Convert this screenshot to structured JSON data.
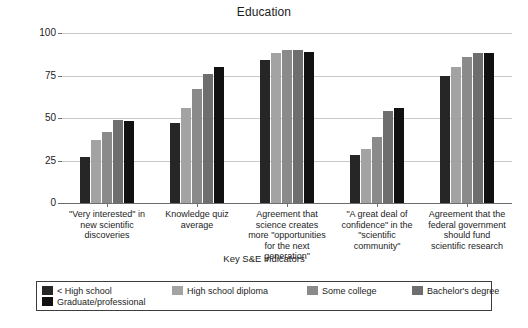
{
  "chart_data": {
    "type": "bar",
    "title": "Education",
    "xlabel": "Key S&E indicators",
    "ylabel": "Percent",
    "ylim": [
      0,
      100
    ],
    "yticks": [
      0,
      25,
      50,
      75,
      100
    ],
    "ytick_labels": [
      "0",
      "25",
      "50",
      "75",
      "100"
    ],
    "grid": true,
    "legend_position": "bottom",
    "categories": [
      "\"Very interested\" in new scientific discoveries",
      "Knowledge quiz average",
      "Agreement that science creates more \"opportunities for the next generation\"",
      "\"A great deal of confidence\" in the \"scientific community\"",
      "Agreement that the federal government should fund scientific research"
    ],
    "category_lines": [
      [
        "\"Very interested\" in",
        "new scientific",
        "discoveries"
      ],
      [
        "Knowledge quiz",
        "average"
      ],
      [
        "Agreement that",
        "science creates",
        "more \"opportunities",
        "for the next",
        "generation\""
      ],
      [
        "\"A great deal of",
        "confidence\" in the",
        "\"scientific",
        "community\""
      ],
      [
        "Agreement that the",
        "federal government",
        "should fund",
        "scientific research"
      ]
    ],
    "series": [
      {
        "name": "< High school",
        "color": "#262626",
        "values": [
          27,
          47,
          84,
          28,
          75
        ]
      },
      {
        "name": "High school diploma",
        "color": "#a3a3a3",
        "values": [
          37,
          56,
          88,
          32,
          80
        ]
      },
      {
        "name": "Some college",
        "color": "#8a8a8a",
        "values": [
          42,
          67,
          90,
          39,
          86
        ]
      },
      {
        "name": "Bachelor's degree",
        "color": "#6e6e6e",
        "values": [
          49,
          76,
          90,
          54,
          88
        ]
      },
      {
        "name": "Graduate/professional",
        "color": "#111111",
        "values": [
          48,
          80,
          89,
          56,
          88
        ]
      }
    ]
  },
  "caption": {
    "text": ""
  }
}
